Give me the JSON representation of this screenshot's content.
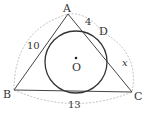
{
  "diagram": {
    "points": {
      "A": {
        "label": "A",
        "x": 68,
        "y": 14
      },
      "B": {
        "label": "B",
        "x": 14,
        "y": 90
      },
      "C": {
        "label": "C",
        "x": 132,
        "y": 92
      },
      "D": {
        "label": "D",
        "x": 102,
        "y": 32
      },
      "O": {
        "label": "O",
        "x": 76,
        "y": 62
      }
    },
    "circle": {
      "cx": 76,
      "cy": 62,
      "r": 31
    },
    "measurements": {
      "AB": "10",
      "AD": "4",
      "DC": "x",
      "BC": "13"
    },
    "colors": {
      "line": "#444444",
      "dashed": "#aaaaaa",
      "text": "#333333"
    }
  }
}
